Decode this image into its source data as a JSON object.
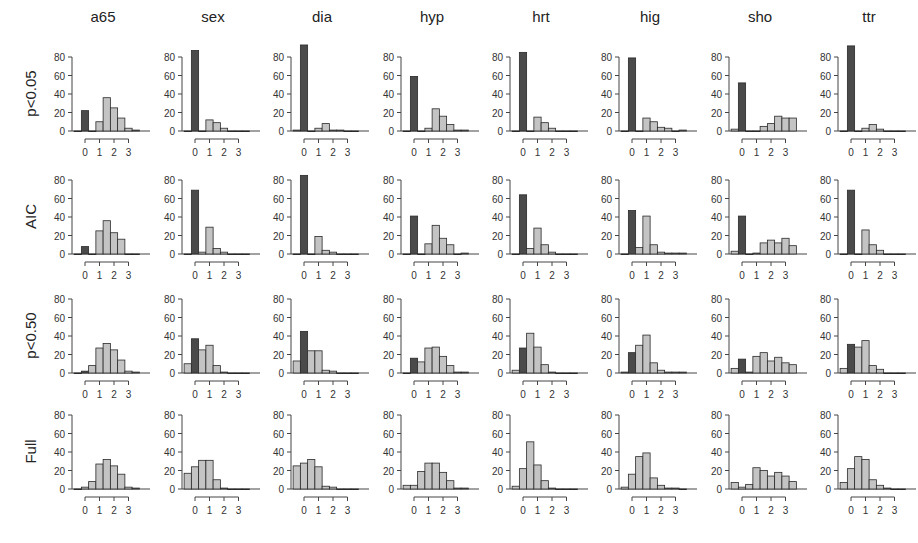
{
  "chart_data": {
    "type": "bar",
    "title": "",
    "layout": {
      "rows": 4,
      "cols": 8,
      "grid": false,
      "legend": "none"
    },
    "columns": [
      "a65",
      "sex",
      "dia",
      "hyp",
      "hrt",
      "hig",
      "sho",
      "ttr"
    ],
    "rows": [
      "p<0.05",
      "AIC",
      "p<0.50",
      "Full"
    ],
    "ylim": [
      0,
      80
    ],
    "yticks": [
      0,
      20,
      40,
      60,
      80
    ],
    "xticks": [
      0,
      1,
      2,
      3
    ],
    "bin_width": 0.5,
    "colors": {
      "highlight": "#4a4a4a",
      "normal": "#c4c4c4",
      "edge": "#2a2a2a"
    },
    "panels": [
      [
        {
          "start": -0.75,
          "values": [
            0,
            22,
            0,
            10,
            36,
            25,
            14,
            3,
            1
          ],
          "dark": [
            1
          ]
        },
        {
          "start": -0.75,
          "values": [
            0,
            87,
            0,
            12,
            9,
            3,
            0,
            0,
            0
          ],
          "dark": [
            1
          ]
        },
        {
          "start": -0.75,
          "values": [
            1,
            93,
            0,
            3,
            8,
            1,
            1,
            0,
            0
          ],
          "dark": [
            1
          ]
        },
        {
          "start": -0.75,
          "values": [
            0,
            59,
            0,
            3,
            24,
            16,
            7,
            1,
            1
          ],
          "dark": [
            1
          ]
        },
        {
          "start": -0.75,
          "values": [
            0,
            85,
            0,
            15,
            9,
            3,
            0,
            0,
            0
          ],
          "dark": [
            1
          ]
        },
        {
          "start": -0.75,
          "values": [
            0,
            79,
            0,
            14,
            10,
            4,
            3,
            0,
            1
          ],
          "dark": [
            1
          ]
        },
        {
          "start": -0.75,
          "values": [
            2,
            52,
            0,
            0,
            5,
            8,
            16,
            14,
            14
          ],
          "dark": [
            1
          ]
        },
        {
          "start": -0.75,
          "values": [
            0,
            92,
            0,
            3,
            7,
            2,
            0,
            0,
            0
          ],
          "dark": [
            1
          ]
        }
      ],
      [
        {
          "start": -0.75,
          "values": [
            0,
            8,
            0,
            25,
            36,
            23,
            16,
            0,
            0
          ],
          "dark": [
            1
          ]
        },
        {
          "start": -0.75,
          "values": [
            0,
            69,
            2,
            29,
            6,
            2,
            0,
            0,
            0
          ],
          "dark": [
            1
          ]
        },
        {
          "start": -0.75,
          "values": [
            0,
            85,
            0,
            19,
            4,
            2,
            0,
            0,
            0
          ],
          "dark": [
            1
          ]
        },
        {
          "start": -0.75,
          "values": [
            0,
            41,
            0,
            11,
            31,
            17,
            10,
            0,
            1
          ],
          "dark": [
            1
          ]
        },
        {
          "start": -0.75,
          "values": [
            0,
            64,
            6,
            28,
            10,
            2,
            0,
            0,
            0
          ],
          "dark": [
            1
          ]
        },
        {
          "start": -0.75,
          "values": [
            0,
            47,
            7,
            41,
            10,
            2,
            1,
            1,
            1
          ],
          "dark": [
            1
          ]
        },
        {
          "start": -0.75,
          "values": [
            3,
            41,
            0,
            1,
            12,
            15,
            12,
            17,
            9
          ],
          "dark": [
            1
          ]
        },
        {
          "start": -0.75,
          "values": [
            0,
            69,
            0,
            26,
            10,
            4,
            0,
            0,
            0
          ],
          "dark": [
            1
          ]
        }
      ],
      [
        {
          "start": -0.75,
          "values": [
            0,
            2,
            8,
            27,
            32,
            25,
            14,
            2,
            1
          ],
          "dark": [
            1
          ]
        },
        {
          "start": -0.75,
          "values": [
            10,
            37,
            25,
            30,
            8,
            1,
            0,
            0,
            0
          ],
          "dark": [
            1
          ]
        },
        {
          "start": -0.75,
          "values": [
            13,
            45,
            24,
            24,
            3,
            2,
            0,
            0,
            0
          ],
          "dark": [
            1
          ]
        },
        {
          "start": -0.75,
          "values": [
            0,
            16,
            12,
            27,
            28,
            18,
            8,
            1,
            1
          ],
          "dark": [
            1
          ]
        },
        {
          "start": -0.75,
          "values": [
            3,
            27,
            43,
            28,
            9,
            1,
            0,
            0,
            0
          ],
          "dark": [
            1
          ]
        },
        {
          "start": -0.75,
          "values": [
            1,
            22,
            30,
            41,
            11,
            3,
            1,
            1,
            1
          ],
          "dark": [
            1
          ]
        },
        {
          "start": -0.75,
          "values": [
            5,
            15,
            1,
            18,
            22,
            13,
            17,
            11,
            9
          ],
          "dark": [
            1
          ]
        },
        {
          "start": -0.75,
          "values": [
            5,
            31,
            28,
            35,
            8,
            4,
            0,
            0,
            0
          ],
          "dark": [
            1
          ]
        }
      ],
      [
        {
          "start": -0.75,
          "values": [
            0,
            2,
            8,
            27,
            32,
            25,
            16,
            2,
            1
          ],
          "dark": []
        },
        {
          "start": -0.75,
          "values": [
            17,
            24,
            31,
            31,
            10,
            1,
            0,
            0,
            0
          ],
          "dark": []
        },
        {
          "start": -0.75,
          "values": [
            25,
            28,
            32,
            24,
            3,
            2,
            0,
            0,
            0
          ],
          "dark": []
        },
        {
          "start": -0.75,
          "values": [
            4,
            4,
            19,
            28,
            28,
            18,
            9,
            1,
            1
          ],
          "dark": []
        },
        {
          "start": -0.75,
          "values": [
            3,
            22,
            51,
            26,
            9,
            1,
            0,
            0,
            0
          ],
          "dark": []
        },
        {
          "start": -0.75,
          "values": [
            2,
            16,
            35,
            39,
            12,
            4,
            1,
            1,
            0
          ],
          "dark": []
        },
        {
          "start": -0.75,
          "values": [
            7,
            2,
            5,
            23,
            20,
            14,
            18,
            14,
            8
          ],
          "dark": []
        },
        {
          "start": -0.75,
          "values": [
            7,
            22,
            35,
            32,
            10,
            4,
            1,
            0,
            0
          ],
          "dark": []
        }
      ]
    ]
  }
}
